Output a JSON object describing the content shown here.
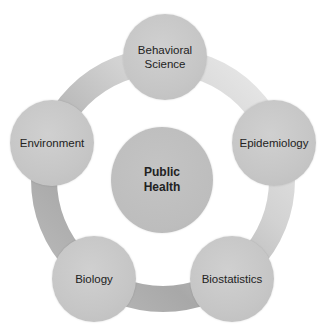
{
  "diagram": {
    "center": {
      "label": "Public\nHealth"
    },
    "nodes": [
      {
        "id": "behavioral-science",
        "label": "Behavioral\nScience"
      },
      {
        "id": "epidemiology",
        "label": "Epidemiology"
      },
      {
        "id": "biostatistics",
        "label": "Biostatistics"
      },
      {
        "id": "biology",
        "label": "Biology"
      },
      {
        "id": "environment",
        "label": "Environment"
      }
    ],
    "colors": {
      "node_fill": "#c6c6c6",
      "center_fill": "#bdbdbd",
      "ring_dark": "#9a9a9a",
      "ring_light": "#e6e6e6",
      "text": "#222222"
    }
  }
}
